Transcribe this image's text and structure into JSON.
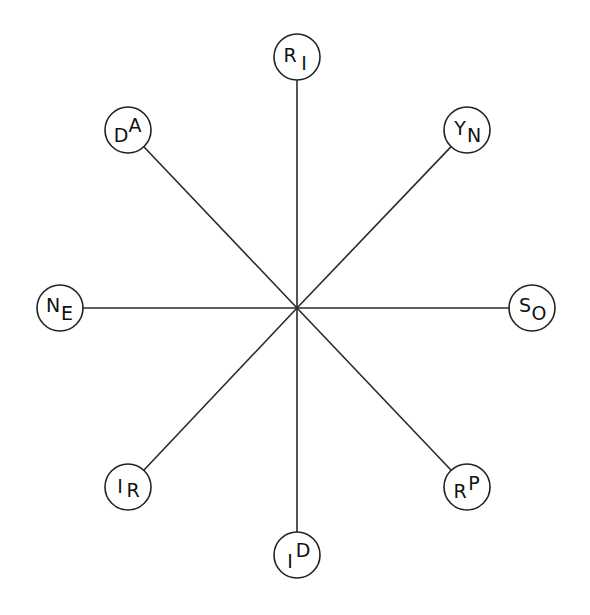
{
  "diagram": {
    "type": "star",
    "hub": {
      "x": 297,
      "y": 308
    },
    "circle_radius": 23,
    "line_color": "#2a2a2a",
    "nodes": [
      {
        "id": "top",
        "x": 297,
        "y": 57,
        "first": "R",
        "second": "I",
        "first_dy": -2,
        "second_dy": 6,
        "first_dx": -7,
        "second_dx": 7
      },
      {
        "id": "top-right",
        "x": 467,
        "y": 130,
        "first": "Y",
        "second": "N",
        "first_dy": -2,
        "second_dy": 5,
        "first_dx": -7,
        "second_dx": 7
      },
      {
        "id": "right",
        "x": 532,
        "y": 308,
        "first": "S",
        "second": "O",
        "first_dy": -3,
        "second_dy": 5,
        "first_dx": -7,
        "second_dx": 7
      },
      {
        "id": "bottom-right",
        "x": 467,
        "y": 487,
        "first": "R",
        "second": "P",
        "first_dy": 4,
        "second_dy": -4,
        "first_dx": -7,
        "second_dx": 7
      },
      {
        "id": "bottom",
        "x": 297,
        "y": 555,
        "first": "I",
        "second": "D",
        "first_dy": 6,
        "second_dy": -5,
        "first_dx": -7,
        "second_dx": 6
      },
      {
        "id": "bottom-left",
        "x": 128,
        "y": 487,
        "first": "I",
        "second": "R",
        "first_dy": -1,
        "second_dy": 3,
        "first_dx": -8,
        "second_dx": 5
      },
      {
        "id": "left",
        "x": 60,
        "y": 308,
        "first": "N",
        "second": "E",
        "first_dy": -3,
        "second_dy": 5,
        "first_dx": -7,
        "second_dx": 7
      },
      {
        "id": "top-left",
        "x": 128,
        "y": 130,
        "first": "D",
        "second": "A",
        "first_dy": 5,
        "second_dy": -5,
        "first_dx": -7,
        "second_dx": 7
      }
    ]
  }
}
